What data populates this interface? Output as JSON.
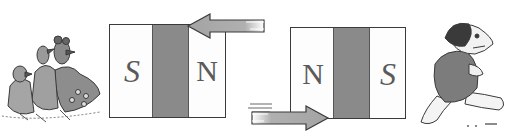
{
  "figure": {
    "colors": {
      "background": "#ffffff",
      "magnet_outline": "#3a3a3a",
      "magnet_band": "#8a8a8a",
      "pole_letter": "#5a5a5a",
      "arrow_fill": "#a9a9a9"
    },
    "magnets": [
      {
        "id": "left",
        "left_pole": "S",
        "right_pole": "N"
      },
      {
        "id": "right",
        "left_pole": "N",
        "right_pole": "S"
      }
    ],
    "arrows": [
      {
        "id": "top-arrow",
        "direction": "left",
        "position": "top-right of left magnet"
      },
      {
        "id": "bottom-arrow",
        "direction": "right",
        "position": "bottom-left of right magnet"
      }
    ],
    "characters": [
      {
        "id": "left-group",
        "description": "group of cartoon birds/animals fleeing left"
      },
      {
        "id": "right-character",
        "description": "cartoon dog in jacket running right"
      }
    ]
  }
}
